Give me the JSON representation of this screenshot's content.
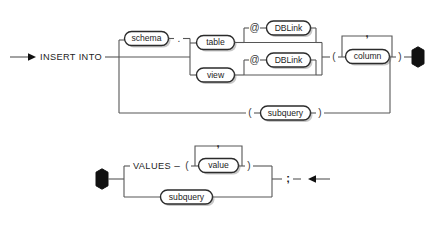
{
  "diagram": {
    "kind": "railroad-syntax-diagram",
    "line_color": "#565656",
    "box_stroke_color": "#2b2b2b",
    "box_fill_color": "#ffffff",
    "node_color": "#111111",
    "background": "#ffffff"
  },
  "row1": {
    "start_arrow": "arrow-right",
    "keyword": "INSERT INTO",
    "schema": "schema",
    "dot": ".",
    "table": "table",
    "view": "view",
    "at_top": "@",
    "at_bottom": "@",
    "dblink_top": "DBLink",
    "dblink_bottom": "DBLink",
    "paren_open": "(",
    "column": "column",
    "comma": ",",
    "paren_close": ")",
    "subquery_paren_open": "(",
    "subquery": "subquery",
    "subquery_paren_close": ")",
    "end_node": "hexagon"
  },
  "row2": {
    "start_node": "hexagon",
    "keyword": "VALUES",
    "dash": "–",
    "paren_open": "(",
    "value": "value",
    "comma": ",",
    "paren_close": ")",
    "subquery": "subquery",
    "semicolon": ";",
    "end_arrow": "arrow-left"
  }
}
